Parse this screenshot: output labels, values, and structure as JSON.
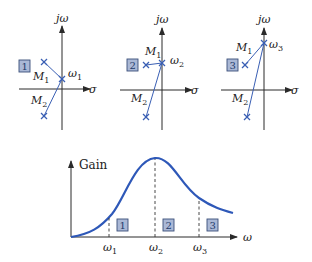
{
  "colors": {
    "curve": "#2e58b8",
    "pole": "#3a5fb4",
    "box_fill": "#aab8d6",
    "axis": "#2a2a2a"
  },
  "pole_zero_plots": [
    {
      "id": "1",
      "box_label": "1",
      "y_axis_label": "jω",
      "x_axis_label": "σ",
      "freq_label": "ω",
      "freq_sub": "1",
      "m1_label": "M",
      "m1_sub": "1",
      "m2_label": "M",
      "m2_sub": "2"
    },
    {
      "id": "2",
      "box_label": "2",
      "y_axis_label": "jω",
      "x_axis_label": "σ",
      "freq_label": "ω",
      "freq_sub": "2",
      "m1_label": "M",
      "m1_sub": "1",
      "m2_label": "M",
      "m2_sub": "2"
    },
    {
      "id": "3",
      "box_label": "3",
      "y_axis_label": "jω",
      "x_axis_label": "σ",
      "freq_label": "ω",
      "freq_sub": "3",
      "m1_label": "M",
      "m1_sub": "1",
      "m2_label": "M",
      "m2_sub": "2"
    }
  ],
  "gain_plot": {
    "y_axis_label": "Gain",
    "x_axis_label": "ω",
    "ticks": [
      {
        "label": "ω",
        "sub": "1",
        "box": "1"
      },
      {
        "label": "ω",
        "sub": "2",
        "box": "2"
      },
      {
        "label": "ω",
        "sub": "3",
        "box": "3"
      }
    ]
  }
}
